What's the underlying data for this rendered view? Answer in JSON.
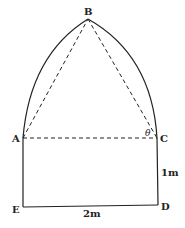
{
  "points": {
    "A": "A",
    "B": "B",
    "C": "C",
    "D": "D",
    "E": "E"
  },
  "angle_label": "θ",
  "dimensions": {
    "width": "2m",
    "height": "1m"
  },
  "colors": {
    "line": "#222222",
    "background": "#ffffff"
  }
}
